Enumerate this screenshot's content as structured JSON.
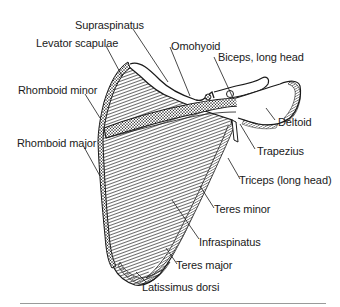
{
  "figure": {
    "labels": {
      "supraspinatus": "Supraspinatus",
      "levator_scapulae": "Levator scapulae",
      "rhomboid_minor": "Rhomboid minor",
      "rhomboid_major": "Rhomboid major",
      "omohyoid": "Omohyoid",
      "biceps_long_head": "Biceps, long head",
      "deltoid": "Deltoid",
      "trapezius": "Trapezius",
      "triceps_long_head": "Triceps (long head)",
      "teres_minor": "Teres minor",
      "infraspinatus": "Infraspinatus",
      "teres_major": "Teres major",
      "latissimus_dorsi": "Latissimus dorsi"
    },
    "colors": {
      "ink": "#1a1a1a",
      "background": "#ffffff",
      "rule": "#9a9a9a"
    }
  }
}
